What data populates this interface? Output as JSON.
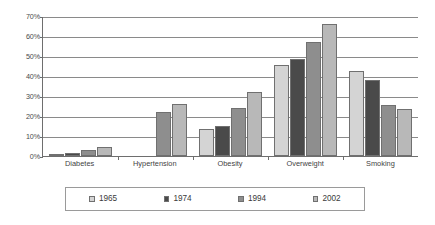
{
  "chart_data": {
    "type": "bar",
    "title": "",
    "subtitle": "",
    "xlabel": "",
    "ylabel": "",
    "ylim": [
      0,
      70
    ],
    "y_tick_labels": [
      "0%",
      "10%",
      "20%",
      "30%",
      "40%",
      "50%",
      "60%",
      "70%"
    ],
    "y_tick_values": [
      0,
      10,
      20,
      30,
      40,
      50,
      60,
      70
    ],
    "grid": true,
    "legend_position": "bottom",
    "categories": [
      "Diabetes",
      "Hypertension",
      "Obesity",
      "Overweight",
      "Smoking"
    ],
    "series": [
      {
        "name": "1965",
        "color": "#d4d4d4",
        "values": [
          0.5,
          null,
          13.5,
          45.5,
          42.5
        ]
      },
      {
        "name": "1974",
        "color": "#4a4a4a",
        "values": [
          1.5,
          null,
          15.0,
          48.5,
          38.0
        ]
      },
      {
        "name": "1994",
        "color": "#8e8e8e",
        "values": [
          3.0,
          22.0,
          24.0,
          57.0,
          25.5
        ]
      },
      {
        "name": "2002",
        "color": "#b8b8b8",
        "values": [
          4.5,
          26.0,
          32.0,
          66.0,
          23.5
        ]
      }
    ]
  },
  "axis": {
    "y_labels": [
      "70%",
      "60%",
      "50%",
      "40%",
      "30%",
      "20%",
      "10%",
      "0%"
    ]
  },
  "legend": {
    "items": [
      {
        "label": "1965"
      },
      {
        "label": "1974"
      },
      {
        "label": "1994"
      },
      {
        "label": "2002"
      }
    ]
  },
  "colors": {
    "series_1965": "#d4d4d4",
    "series_1974": "#4a4a4a",
    "series_1994": "#8e8e8e",
    "series_2002": "#b8b8b8",
    "axis_line": "#6e6e6e",
    "gridline": "#8a8a8a",
    "background": "#ffffff",
    "text": "#3a3a3a"
  }
}
